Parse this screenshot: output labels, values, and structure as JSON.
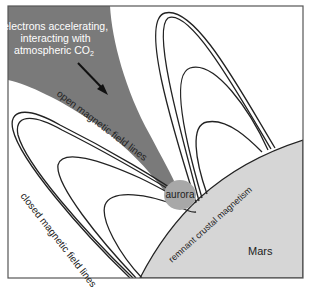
{
  "diagram": {
    "labels": {
      "electrons_line1": "electrons accelerating,",
      "electrons_line2": "interacting with",
      "electrons_line3": "atmospheric CO",
      "electrons_sub": "2",
      "open_lines": "open magnetic field lines",
      "closed_lines": "closed magnetic field lines",
      "aurora": "aurora",
      "crustal": "remnant crustal magnetism",
      "planet": "Mars"
    },
    "colors": {
      "frame": "#555555",
      "wedge": "#7a7a7a",
      "mars": "#d6d6d6",
      "aurora": "#a8a8a8",
      "lines": "#222222",
      "background": "#ffffff"
    }
  }
}
